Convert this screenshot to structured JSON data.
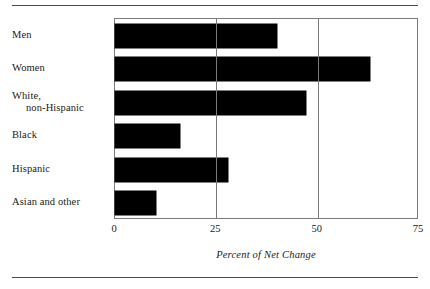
{
  "chart_data": {
    "type": "bar",
    "orientation": "horizontal",
    "title": "",
    "xlabel": "Percent of Net Change",
    "ylabel": "",
    "xlim": [
      0,
      75
    ],
    "xticks": [
      0,
      25,
      50,
      75
    ],
    "xtick_labels": [
      "0",
      "25",
      "50",
      "75"
    ],
    "grid": true,
    "gridlines_at": [
      25,
      50
    ],
    "legend": false,
    "bar_color": "#000000",
    "categories": [
      "Men",
      "Women",
      "White, non-Hispanic",
      "Black",
      "Hispanic",
      "Asian and other"
    ],
    "values": [
      40,
      63,
      47,
      16,
      28,
      10
    ],
    "bars": [
      {
        "label_line1": "Men",
        "label_line2": "",
        "value": 40
      },
      {
        "label_line1": "Women",
        "label_line2": "",
        "value": 63
      },
      {
        "label_line1": "White,",
        "label_line2": "non-Hispanic",
        "value": 47
      },
      {
        "label_line1": "Black",
        "label_line2": "",
        "value": 16
      },
      {
        "label_line1": "Hispanic",
        "label_line2": "",
        "value": 28
      },
      {
        "label_line1": "Asian and other",
        "label_line2": "",
        "value": 10
      }
    ]
  },
  "figure": {
    "rule_color": "#4a4a4a",
    "frame_color": "#7a7a7a"
  }
}
